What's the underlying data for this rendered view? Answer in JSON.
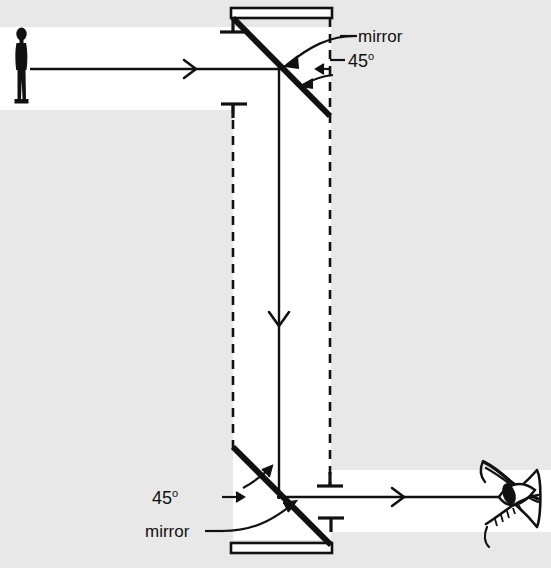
{
  "figure": {
    "background_color": "#e8e8e8",
    "beam_color": "#ffffff",
    "ink_color": "#111111"
  },
  "labels": {
    "mirror_top": "mirror",
    "angle_top": "45",
    "angle_top_unit": "o",
    "angle_bottom": "45",
    "angle_bottom_unit": "o",
    "mirror_bottom": "mirror"
  },
  "objects": {
    "observer": "person-silhouette",
    "viewer": "eye-icon",
    "mirror_top_icon": "mirror-top",
    "mirror_bottom_icon": "mirror-bottom"
  },
  "rays": {
    "incoming": {
      "name": "horizontal-ray-top",
      "direction": "right",
      "from_x": 30,
      "to_x": 279,
      "y": 69
    },
    "vertical": {
      "name": "vertical-ray",
      "direction": "down",
      "x": 279,
      "from_y": 69,
      "to_y": 497
    },
    "outgoing": {
      "name": "horizontal-ray-bottom",
      "direction": "right",
      "from_x": 279,
      "to_x": 513,
      "y": 497
    }
  },
  "construction_lines": {
    "left_dashed_x": 233,
    "right_dashed_x": 330,
    "tick_marks": 4
  }
}
